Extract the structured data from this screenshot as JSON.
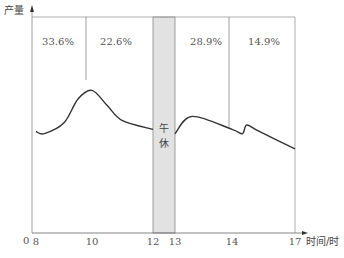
{
  "chart_data": {
    "type": "line",
    "title": "",
    "ylabel": "产量",
    "xlabel": "时间/时",
    "origin_label": "0",
    "x_ticks": [
      8,
      10,
      12,
      13,
      14,
      17
    ],
    "xlim": [
      8,
      17
    ],
    "break_period": {
      "label": "午休",
      "from": 12,
      "to": 13
    },
    "segments": [
      {
        "from": 8,
        "to": 10,
        "share": "33.6%"
      },
      {
        "from": 10,
        "to": 12,
        "share": "22.6%"
      },
      {
        "from": 13,
        "to": 14,
        "share": "28.9%"
      },
      {
        "from": 14,
        "to": 17,
        "share": "14.9%"
      }
    ],
    "dividers": [
      10,
      14
    ],
    "curve_morning": [
      [
        8,
        0.47
      ],
      [
        8.3,
        0.46
      ],
      [
        9,
        0.51
      ],
      [
        9.5,
        0.62
      ],
      [
        10,
        0.66
      ],
      [
        10.5,
        0.59
      ],
      [
        11,
        0.52
      ],
      [
        12,
        0.48
      ]
    ],
    "curve_afternoon": [
      [
        13,
        0.46
      ],
      [
        13.3,
        0.54
      ],
      [
        14,
        0.48
      ],
      [
        14.5,
        0.46
      ],
      [
        14.7,
        0.5
      ],
      [
        15.3,
        0.47
      ],
      [
        17,
        0.39
      ]
    ],
    "ylim": [
      0,
      1
    ],
    "grid": false
  }
}
